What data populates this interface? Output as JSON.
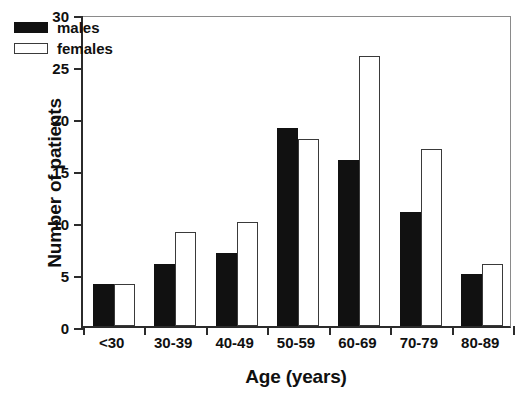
{
  "chart_data": {
    "type": "bar",
    "title": "",
    "subtitle": "",
    "xlabel": "Age (years)",
    "ylabel": "Number of patients",
    "categories": [
      "<30",
      "30-39",
      "40-49",
      "50-59",
      "60-69",
      "70-79",
      "80-89"
    ],
    "series": [
      {
        "name": "males",
        "values": [
          4,
          6,
          7,
          19,
          16,
          11,
          5
        ],
        "color": "#111111",
        "fill": "solid"
      },
      {
        "name": "females",
        "values": [
          4,
          9,
          10,
          18,
          26,
          17,
          6
        ],
        "color": "#ffffff",
        "fill": "outline"
      }
    ],
    "ylim": [
      0,
      30
    ],
    "yticks": [
      0,
      5,
      10,
      15,
      20,
      25,
      30
    ],
    "ytick_labels": [
      "0",
      "5",
      "10",
      "15",
      "20",
      "25",
      "30"
    ],
    "grid": false,
    "legend_position": "top-left",
    "legend_entries": [
      "males",
      "females"
    ]
  }
}
